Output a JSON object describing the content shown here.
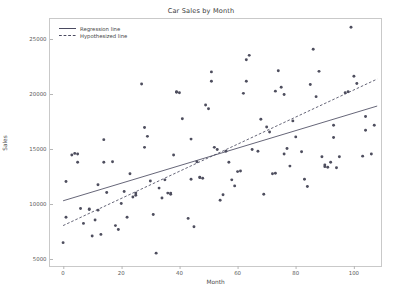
{
  "chart_data": {
    "type": "scatter",
    "title": "Car Sales by Month",
    "xlabel": "Month",
    "ylabel": "Sales",
    "xlim": [
      -4.5,
      110
    ],
    "ylim": [
      4200,
      26800
    ],
    "xticks": [
      0,
      20,
      40,
      60,
      80,
      100
    ],
    "yticks": [
      5000,
      10000,
      15000,
      20000,
      25000
    ],
    "grid": false,
    "legend_position": "upper-left",
    "marker_color": "#4e4e5e",
    "line_color": "#4a4a60",
    "series": [
      {
        "name": "Car sales observations",
        "type": "scatter",
        "points": [
          [
            0,
            6500
          ],
          [
            1,
            12050
          ],
          [
            1,
            8800
          ],
          [
            3,
            14450
          ],
          [
            4,
            14600
          ],
          [
            5,
            14550
          ],
          [
            5,
            13800
          ],
          [
            6,
            9600
          ],
          [
            7,
            8250
          ],
          [
            9,
            9550
          ],
          [
            9,
            9500
          ],
          [
            10,
            7100
          ],
          [
            11,
            8550
          ],
          [
            12,
            11750
          ],
          [
            12,
            9450
          ],
          [
            13,
            7250
          ],
          [
            14,
            13800
          ],
          [
            14,
            15850
          ],
          [
            15,
            11050
          ],
          [
            17,
            13850
          ],
          [
            18,
            8050
          ],
          [
            19,
            7700
          ],
          [
            20,
            10050
          ],
          [
            21,
            11150
          ],
          [
            22,
            8800
          ],
          [
            23,
            12750
          ],
          [
            24,
            10650
          ],
          [
            25,
            10800
          ],
          [
            25,
            11000
          ],
          [
            27,
            20900
          ],
          [
            28,
            16950
          ],
          [
            28,
            15150
          ],
          [
            29,
            16150
          ],
          [
            30,
            12100
          ],
          [
            31,
            9050
          ],
          [
            32,
            5550
          ],
          [
            33,
            11450
          ],
          [
            34,
            10550
          ],
          [
            35,
            12200
          ],
          [
            36,
            11000
          ],
          [
            37,
            11000
          ],
          [
            37,
            10900
          ],
          [
            38,
            14450
          ],
          [
            39,
            20200
          ],
          [
            39,
            20150
          ],
          [
            40,
            20100
          ],
          [
            41,
            17750
          ],
          [
            43,
            8700
          ],
          [
            44,
            12250
          ],
          [
            44,
            15900
          ],
          [
            45,
            7950
          ],
          [
            46,
            13850
          ],
          [
            47,
            12400
          ],
          [
            47,
            12450
          ],
          [
            48,
            12350
          ],
          [
            49,
            19000
          ],
          [
            50,
            18650
          ],
          [
            51,
            21150
          ],
          [
            51,
            22000
          ],
          [
            52,
            15150
          ],
          [
            53,
            14950
          ],
          [
            54,
            10350
          ],
          [
            55,
            10850
          ],
          [
            56,
            14800
          ],
          [
            57,
            13800
          ],
          [
            58,
            12200
          ],
          [
            59,
            11650
          ],
          [
            60,
            12950
          ],
          [
            61,
            13000
          ],
          [
            62,
            20050
          ],
          [
            63,
            23100
          ],
          [
            63,
            21150
          ],
          [
            64,
            23500
          ],
          [
            65,
            14950
          ],
          [
            67,
            14800
          ],
          [
            68,
            17700
          ],
          [
            69,
            10900
          ],
          [
            70,
            17000
          ],
          [
            71,
            16550
          ],
          [
            72,
            12750
          ],
          [
            73,
            12800
          ],
          [
            73,
            20250
          ],
          [
            74,
            22100
          ],
          [
            75,
            20600
          ],
          [
            76,
            19950
          ],
          [
            76,
            14550
          ],
          [
            77,
            15050
          ],
          [
            78,
            13450
          ],
          [
            79,
            17550
          ],
          [
            80,
            16100
          ],
          [
            82,
            14750
          ],
          [
            83,
            12250
          ],
          [
            84,
            11600
          ],
          [
            85,
            20850
          ],
          [
            86,
            24050
          ],
          [
            87,
            19750
          ],
          [
            88,
            22050
          ],
          [
            89,
            14300
          ],
          [
            90,
            13400
          ],
          [
            90,
            13550
          ],
          [
            91,
            13350
          ],
          [
            92,
            13800
          ],
          [
            93,
            16050
          ],
          [
            93,
            17150
          ],
          [
            94,
            13300
          ],
          [
            95,
            14300
          ],
          [
            97,
            20100
          ],
          [
            98,
            20200
          ],
          [
            99,
            26050
          ],
          [
            100,
            21600
          ],
          [
            101,
            20950
          ],
          [
            103,
            14350
          ],
          [
            104,
            17950
          ],
          [
            104,
            16700
          ],
          [
            106,
            14550
          ],
          [
            107,
            17150
          ]
        ]
      },
      {
        "name": "Regression line",
        "type": "line",
        "style": "solid",
        "endpoints": [
          [
            0,
            10300
          ],
          [
            108,
            18900
          ]
        ]
      },
      {
        "name": "Hypothesized line",
        "type": "line",
        "style": "dashed",
        "endpoints": [
          [
            0,
            8050
          ],
          [
            108,
            21350
          ]
        ]
      }
    ],
    "legend": [
      {
        "label": "Regression line",
        "style": "solid"
      },
      {
        "label": "Hypothesized line",
        "style": "dashed"
      }
    ]
  }
}
